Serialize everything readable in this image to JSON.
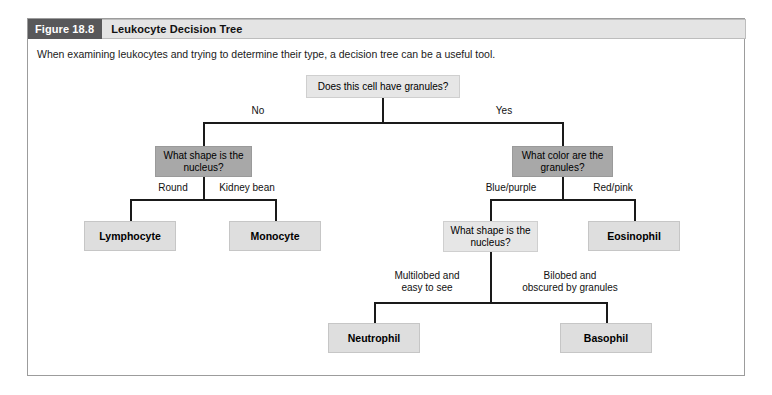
{
  "figure": {
    "number": "Figure 18.8",
    "title": "Leukocyte Decision Tree",
    "caption": "When examining leukocytes and trying to determine their type, a decision tree can be a useful tool."
  },
  "colors": {
    "header_number_bg": "#58585a",
    "header_title_bg": "#e4e4e4",
    "decision_light_bg": "#e6e6e6",
    "decision_medium_bg": "#a8a8a8",
    "leaf_bg": "#dedede",
    "line": "#1a1a1a",
    "frame_border": "#9c9c9c"
  },
  "diagram": {
    "type": "decision-tree",
    "root": {
      "id": "root",
      "label": "Does this cell have granules?",
      "style": "light"
    },
    "nodes": [
      {
        "id": "root",
        "label": "Does this cell have granules?",
        "style": "light",
        "kind": "decision"
      },
      {
        "id": "shape-nucleus-1",
        "label": "What shape is\nthe nucleus?",
        "style": "medium",
        "kind": "decision"
      },
      {
        "id": "color-granules",
        "label": "What color are\nthe granules?",
        "style": "medium",
        "kind": "decision"
      },
      {
        "id": "shape-nucleus-2",
        "label": "What shape is\nthe nucleus?",
        "style": "light",
        "kind": "decision"
      },
      {
        "id": "lymphocyte",
        "label": "Lymphocyte",
        "style": "leaf",
        "kind": "outcome"
      },
      {
        "id": "monocyte",
        "label": "Monocyte",
        "style": "leaf",
        "kind": "outcome"
      },
      {
        "id": "eosinophil",
        "label": "Eosinophil",
        "style": "leaf",
        "kind": "outcome"
      },
      {
        "id": "neutrophil",
        "label": "Neutrophil",
        "style": "leaf",
        "kind": "outcome"
      },
      {
        "id": "basophil",
        "label": "Basophil",
        "style": "leaf",
        "kind": "outcome"
      }
    ],
    "edges": [
      {
        "from": "root",
        "to": "shape-nucleus-1",
        "label": "No"
      },
      {
        "from": "root",
        "to": "color-granules",
        "label": "Yes"
      },
      {
        "from": "shape-nucleus-1",
        "to": "lymphocyte",
        "label": "Round"
      },
      {
        "from": "shape-nucleus-1",
        "to": "monocyte",
        "label": "Kidney bean"
      },
      {
        "from": "color-granules",
        "to": "shape-nucleus-2",
        "label": "Blue/purple"
      },
      {
        "from": "color-granules",
        "to": "eosinophil",
        "label": "Red/pink"
      },
      {
        "from": "shape-nucleus-2",
        "to": "neutrophil",
        "label": "Multilobed and\neasy to see"
      },
      {
        "from": "shape-nucleus-2",
        "to": "basophil",
        "label": "Bilobed and\nobscured by granules"
      }
    ],
    "node_labels": {
      "root": "Does this cell have granules?",
      "shape_nucleus_1": "What shape is\nthe nucleus?",
      "color_granules": "What color are\nthe granules?",
      "shape_nucleus_2": "What shape is\nthe nucleus?",
      "lymphocyte": "Lymphocyte",
      "monocyte": "Monocyte",
      "eosinophil": "Eosinophil",
      "neutrophil": "Neutrophil",
      "basophil": "Basophil"
    },
    "edge_labels": {
      "no": "No",
      "yes": "Yes",
      "round": "Round",
      "kidney_bean": "Kidney bean",
      "blue_purple": "Blue/purple",
      "red_pink": "Red/pink",
      "multilobed": "Multilobed and\neasy to see",
      "bilobed": "Bilobed and\nobscured by granules"
    }
  }
}
